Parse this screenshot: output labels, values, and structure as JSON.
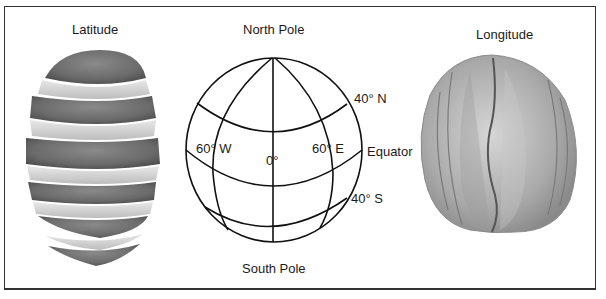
{
  "figure": {
    "left_panel": {
      "title": "Latitude",
      "illustration": "orange-sliced-horizontally"
    },
    "center_panel": {
      "top_label": "North Pole",
      "bottom_label": "South Pole",
      "parallels": [
        {
          "label": "40° N"
        },
        {
          "label": "Equator"
        },
        {
          "label": "40° S"
        }
      ],
      "meridians": [
        {
          "label": "60° W"
        },
        {
          "label": "0°"
        },
        {
          "label": "60° E"
        }
      ]
    },
    "right_panel": {
      "title": "Longitude",
      "illustration": "orange-segmented-vertically"
    }
  },
  "colors": {
    "frame": "#333333",
    "line": "#111111",
    "text": "#1a1a1a",
    "peel_dark": "#6e6e6e",
    "pith_light": "#d8d8d8"
  }
}
